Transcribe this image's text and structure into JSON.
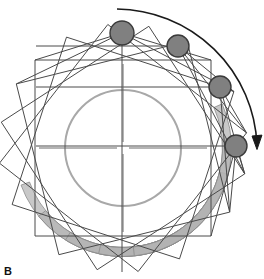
{
  "figure": {
    "panel_label": "B",
    "title": "",
    "width": 264,
    "height": 279,
    "background_color": "#ffffff"
  },
  "colors": {
    "marker_fill": "#808080",
    "marker_stroke": "#3a3a3a",
    "band_fill": "#b3b3b3",
    "band_stroke": "#8a8a8a",
    "frame_stroke": "#4a4a4a",
    "circle_stroke": "#a8a8a8",
    "crosshair_stroke": "#6b6b6b",
    "arrow_stroke": "#1a1a1a",
    "label_color": "#111111"
  },
  "chart_data": {
    "type": "scatter",
    "title": "",
    "xlabel": "",
    "ylabel": "",
    "xlim": [
      0,
      264
    ],
    "ylim": [
      0,
      279
    ],
    "grid": false,
    "legend": null,
    "center": {
      "x": 123,
      "y": 148
    },
    "inner_circle": {
      "cx": 123,
      "cy": 148,
      "r": 58,
      "stroke_width": 2
    },
    "crosshair": {
      "h_half_length": 84,
      "v_half_length": 84,
      "center_gap": 6
    },
    "markers": [
      {
        "id": "marker-1",
        "label": "",
        "cx": 122,
        "cy": 33,
        "r": 12,
        "angle_deg": 90
      },
      {
        "id": "marker-2",
        "label": "",
        "cx": 178,
        "cy": 46,
        "r": 11,
        "angle_deg": 68
      },
      {
        "id": "marker-3",
        "label": "",
        "cx": 220,
        "cy": 87,
        "r": 11,
        "angle_deg": 40
      },
      {
        "id": "marker-4",
        "label": "",
        "cx": 236,
        "cy": 146,
        "r": 11,
        "angle_deg": 2
      }
    ],
    "frames": [
      {
        "id": "frame-1",
        "rotation_deg": 0,
        "cx": 123,
        "cy": 148,
        "half_w": 88,
        "half_h": 88
      },
      {
        "id": "frame-2",
        "rotation_deg": 18,
        "cx": 123,
        "cy": 148,
        "half_w": 88,
        "half_h": 88
      },
      {
        "id": "frame-3",
        "rotation_deg": 38,
        "cx": 123,
        "cy": 148,
        "half_w": 88,
        "half_h": 88
      },
      {
        "id": "frame-4",
        "rotation_deg": 57,
        "cx": 123,
        "cy": 148,
        "half_w": 88,
        "half_h": 88
      },
      {
        "id": "frame-5",
        "rotation_deg": 76,
        "cx": 123,
        "cy": 148,
        "half_w": 88,
        "half_h": 88
      }
    ],
    "bands": [
      {
        "id": "band-1",
        "rotation_deg": 0,
        "radius": 104,
        "thickness": 9,
        "span_deg": 108
      },
      {
        "id": "band-2",
        "rotation_deg": 19,
        "radius": 104,
        "thickness": 9,
        "span_deg": 108
      },
      {
        "id": "band-3",
        "rotation_deg": 38,
        "radius": 104,
        "thickness": 9,
        "span_deg": 108
      },
      {
        "id": "band-4",
        "rotation_deg": 57,
        "radius": 104,
        "thickness": 9,
        "span_deg": 108
      },
      {
        "id": "band-5",
        "rotation_deg": 76,
        "radius": 104,
        "thickness": 9,
        "span_deg": 108
      }
    ],
    "rotation_arrow": {
      "start": {
        "x": 117,
        "y": 9
      },
      "end": {
        "x": 257,
        "y": 145
      },
      "radius": 142,
      "direction": "clockwise",
      "arrowhead_size": 9
    },
    "connector_lines": [
      {
        "from": "marker-1",
        "to": "frame-vertex-a"
      },
      {
        "from": "marker-1",
        "to": "frame-vertex-b"
      },
      {
        "from": "marker-1",
        "to": "frame-vertex-c"
      },
      {
        "from": "marker-2",
        "to": "frame-vertex-a"
      },
      {
        "from": "marker-2",
        "to": "frame-vertex-b"
      },
      {
        "from": "marker-3",
        "to": "frame-vertex-a"
      },
      {
        "from": "marker-3",
        "to": "frame-vertex-b"
      },
      {
        "from": "marker-4",
        "to": "frame-vertex-a"
      },
      {
        "from": "marker-4",
        "to": "frame-vertex-b"
      }
    ]
  }
}
